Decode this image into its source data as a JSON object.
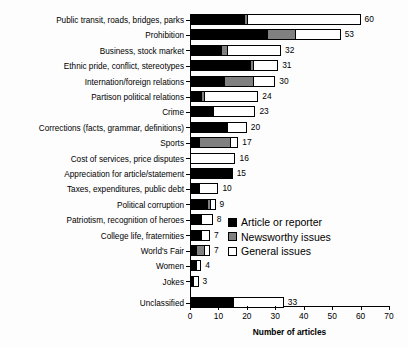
{
  "chart_data": {
    "type": "bar",
    "orientation": "horizontal",
    "stacked": true,
    "title": "",
    "xlabel": "Number of articles",
    "ylabel": "",
    "xlim": [
      0,
      70
    ],
    "xticks": [
      0,
      10,
      20,
      30,
      40,
      50,
      60,
      70
    ],
    "grid": false,
    "legend_position": "center-right",
    "categories": [
      "Public transit, roads, bridges, parks",
      "Prohibition",
      "Business, stock market",
      "Ethnic pride, conflict, stereotypes",
      "Internation/foreign relations",
      "Partison political relations",
      "Crime",
      "Corrections (facts, grammar, definitions)",
      "Sports",
      "Cost of services, price disputes",
      "Appreciation for article/statement",
      "Taxes, expenditures, public debt",
      "Political corruption",
      "Patriotism, recognition of heroes",
      "College life, fraternities",
      "World's Fair",
      "Women",
      "Jokes",
      "Unclassified"
    ],
    "series": [
      {
        "name": "Article or  reporter",
        "color": "#000000",
        "values": [
          19,
          27,
          11,
          21,
          12,
          4,
          8,
          13,
          3,
          0,
          15,
          3,
          6,
          4,
          4,
          2,
          2,
          1,
          15
        ]
      },
      {
        "name": "Newsworthy issues",
        "color": "#808080",
        "values": [
          1,
          10,
          2,
          1,
          10,
          1,
          0,
          0,
          11,
          0,
          0,
          0,
          1,
          0,
          0,
          3,
          0,
          0,
          0
        ]
      },
      {
        "name": "General issues",
        "color": "#ffffff",
        "values": [
          40,
          16,
          19,
          9,
          8,
          19,
          15,
          7,
          3,
          16,
          0,
          7,
          2,
          4,
          3,
          2,
          2,
          2,
          18
        ]
      }
    ],
    "totals": [
      60,
      53,
      32,
      31,
      30,
      24,
      23,
      20,
      17,
      16,
      15,
      10,
      9,
      8,
      7,
      7,
      4,
      3,
      33
    ],
    "total_labels": [
      "60",
      "53",
      "32",
      "31",
      "30",
      "24",
      "23",
      "20",
      "17",
      "16",
      "15",
      "10",
      "9",
      "8",
      "7",
      "7",
      "4",
      "3",
      "33"
    ],
    "xtick_labels": [
      "0",
      "10",
      "20",
      "30",
      "40",
      "50",
      "60",
      "70"
    ]
  },
  "legend": {
    "items": [
      {
        "label": "Article or  reporter",
        "swatch": "black"
      },
      {
        "label": "Newsworthy issues",
        "swatch": "gray"
      },
      {
        "label": "General issues",
        "swatch": "white"
      }
    ]
  }
}
